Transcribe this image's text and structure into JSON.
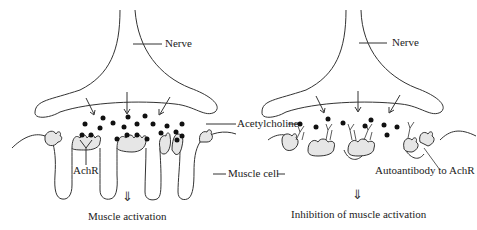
{
  "diagram": {
    "type": "neuromuscular junction comparison",
    "colors": {
      "line": "#333333",
      "fill_receptor": "#e6e6e6",
      "dot": "#111111",
      "background": "#ffffff"
    },
    "left_panel": {
      "labels": {
        "nerve": "Nerve",
        "achr": "AchR",
        "outcome": "Muscle activation"
      },
      "arrow_glyph": "⇓"
    },
    "shared_labels": {
      "acetylcholine": "Acetylcholine",
      "muscle_cell": "Muscle cell"
    },
    "right_panel": {
      "labels": {
        "nerve": "Nerve",
        "autoantibody": "Autoantibody to AchR",
        "outcome": "Inhibition of muscle activation"
      },
      "arrow_glyph": "⇓"
    }
  }
}
